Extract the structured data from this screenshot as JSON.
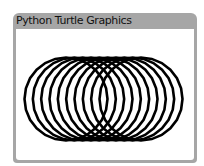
{
  "window": {
    "title": "Python Turtle Graphics"
  },
  "drawing": {
    "shape": "circle-polygon",
    "count": 10,
    "sides": 24,
    "stroke_color": "#000000"
  }
}
